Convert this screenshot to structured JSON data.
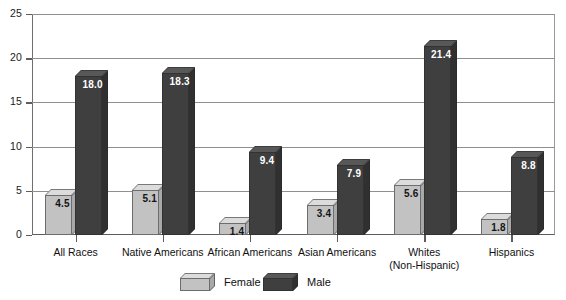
{
  "chart_data": {
    "type": "bar",
    "title": "",
    "subtitle": "",
    "xlabel": "",
    "ylabel": "",
    "ylim": [
      0,
      25
    ],
    "yticks": [
      0,
      5,
      10,
      15,
      20,
      25
    ],
    "ytick_labels": [
      "0",
      "5",
      "10",
      "15",
      "20",
      "25"
    ],
    "grid": "horizontal",
    "legend_position": "bottom-center",
    "categories": [
      "All Races",
      "Native Americans",
      "African Americans",
      "Asian Americans",
      "Whites (Non-Hispanic)",
      "Hispanics"
    ],
    "category_lines": [
      [
        "All Races"
      ],
      [
        "Native Americans"
      ],
      [
        "African Americans"
      ],
      [
        "Asian Americans"
      ],
      [
        "Whites",
        "(Non-Hispanic)"
      ],
      [
        "Hispanics"
      ]
    ],
    "series": [
      {
        "name": "Female",
        "color": "#c2c2c2",
        "values": [
          4.5,
          5.1,
          1.4,
          3.4,
          5.6,
          1.8
        ],
        "labels": [
          "4.5",
          "5.1",
          "1.4",
          "3.4",
          "5.6",
          "1.8"
        ]
      },
      {
        "name": "Male",
        "color": "#3f3f3f",
        "values": [
          18.0,
          18.3,
          9.4,
          7.9,
          21.4,
          8.8
        ],
        "labels": [
          "18.0",
          "18.3",
          "9.4",
          "7.9",
          "21.4",
          "8.8"
        ]
      }
    ]
  },
  "legend": {
    "items": [
      {
        "label": "Female",
        "swatch": "female-swatch"
      },
      {
        "label": "Male",
        "swatch": "male-swatch"
      }
    ]
  },
  "colors": {
    "female_bar": "#c2c2c2",
    "male_bar": "#3f3f3f",
    "gridline": "#8f8f8f",
    "axis": "#5d5d5d",
    "background": "#ffffff",
    "label_on_dark": "#ffffff",
    "label_on_light": "#141414"
  }
}
